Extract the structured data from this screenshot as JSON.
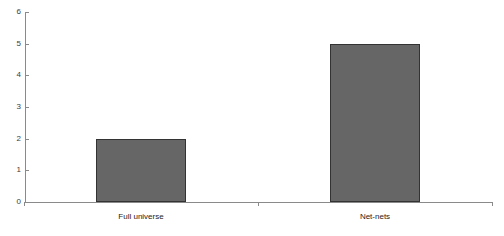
{
  "chart_data": {
    "type": "bar",
    "title": "",
    "subtitle": "",
    "xlabel": "",
    "ylabel": "",
    "categories": [
      "Full universe",
      "Net-nets"
    ],
    "values": [
      2,
      5
    ],
    "series": [
      {
        "name": "",
        "values": [
          2,
          5
        ]
      }
    ],
    "ylim": [
      0,
      6
    ],
    "y_ticks": [
      "0",
      "1",
      "2",
      "3",
      "4",
      "5",
      "6"
    ],
    "y_tick_values": [
      0,
      1,
      2,
      3,
      4,
      5,
      6
    ],
    "grid": false,
    "legend": false,
    "legend_position": "none",
    "bar_fill_color": "#666666",
    "bar_border_color": "#333333",
    "axis_color": "#8a8a8a",
    "background_color": "#ffffff"
  }
}
